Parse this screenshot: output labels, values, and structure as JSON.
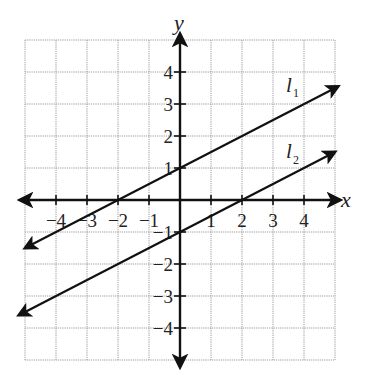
{
  "chart_data": {
    "type": "line",
    "title": "",
    "xlabel": "x",
    "ylabel": "y",
    "xlim": [
      -5,
      5
    ],
    "ylim": [
      -5,
      5
    ],
    "grid": true,
    "x_ticks": [
      -4,
      -3,
      -2,
      -1,
      1,
      2,
      3,
      4
    ],
    "y_ticks": [
      -4,
      -3,
      -2,
      -1,
      1,
      2,
      3,
      4
    ],
    "x_tick_labels": [
      "−4",
      "−3",
      "−2",
      "−1",
      "1",
      "2",
      "3",
      "4"
    ],
    "y_tick_labels": [
      "−4",
      "−3",
      "−2",
      "−1",
      "1",
      "2",
      "3",
      "4"
    ],
    "series": [
      {
        "name": "l1",
        "label_main": "l",
        "label_sub": "1",
        "equation": "y = 0.5x + 1",
        "slope": 0.5,
        "intercept": 1,
        "points": [
          [
            -5,
            -1.5
          ],
          [
            -2,
            0
          ],
          [
            0,
            1
          ],
          [
            2,
            2
          ],
          [
            5.1,
            3.55
          ]
        ],
        "x_intercept": -2,
        "y_intercept": 1
      },
      {
        "name": "l2",
        "label_main": "l",
        "label_sub": "2",
        "equation": "y = 0.5x - 1",
        "slope": 0.5,
        "intercept": -1,
        "points": [
          [
            -5.2,
            -3.6
          ],
          [
            0,
            -1
          ],
          [
            2,
            0
          ],
          [
            5,
            1.5
          ]
        ],
        "x_intercept": 2,
        "y_intercept": -1
      }
    ],
    "annotations": [
      "parallel lines l1 and l2 with equal slope 1/2"
    ]
  },
  "axis_labels": {
    "x": "x",
    "y": "y"
  },
  "line_labels": {
    "l1_main": "l",
    "l1_sub": "1",
    "l2_main": "l",
    "l2_sub": "2"
  }
}
